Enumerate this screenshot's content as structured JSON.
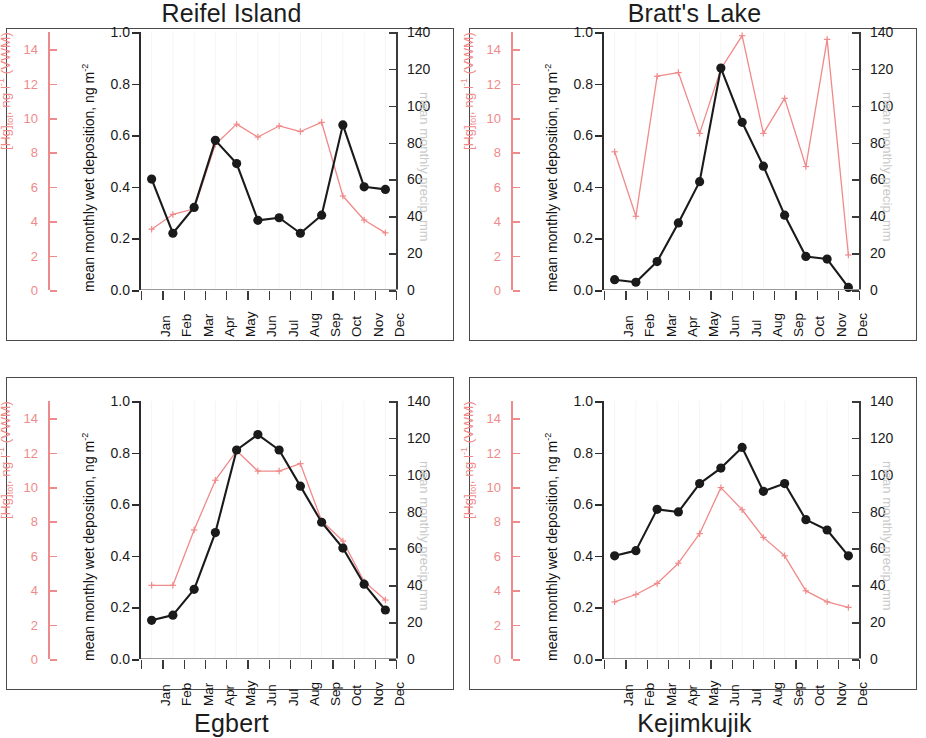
{
  "figure": {
    "months": [
      "Jan",
      "Feb",
      "Mar",
      "Apr",
      "May",
      "Jun",
      "Jul",
      "Aug",
      "Sep",
      "Oct",
      "Nov",
      "Dec"
    ],
    "colors": {
      "hg_red": "#f08a8a",
      "deposition_black": "#1a1a1a",
      "precip_grey": "#c9c9c9",
      "frame": "#4a4a4a"
    },
    "axes": {
      "hg": {
        "label_plain": "[Hg]tot, ng l-1 (VWM)",
        "label_main": "[Hg]",
        "label_sub": "tot",
        "label_mid": ", ng l",
        "label_sup": "-1",
        "label_tail": " (VWM)",
        "ticks": [
          0,
          2,
          4,
          6,
          8,
          10,
          12,
          14
        ],
        "min": 0,
        "max": 15
      },
      "deposition": {
        "label_plain": "mean monthly wet deposition, ng m-2",
        "label_main": "mean monthly wet deposition, ng m",
        "label_sup": "-2",
        "ticks": [
          "0.0",
          "0.2",
          "0.4",
          "0.6",
          "0.8",
          "1.0"
        ],
        "tick_values": [
          0,
          0.2,
          0.4,
          0.6,
          0.8,
          1.0
        ],
        "min": 0,
        "max": 1.0
      },
      "precip": {
        "label_plain": "mean monthly precip, mm",
        "ticks": [
          0,
          20,
          40,
          60,
          80,
          100,
          120,
          140
        ],
        "min": 0,
        "max": 140
      }
    }
  },
  "chart_data": [
    {
      "type": "line",
      "title": "Reifel Island",
      "title_position": "top",
      "panel": "top-left",
      "x": [
        "Jan",
        "Feb",
        "Mar",
        "Apr",
        "May",
        "Jun",
        "Jul",
        "Aug",
        "Sep",
        "Oct",
        "Nov",
        "Dec"
      ],
      "xlabel": "",
      "grid": false,
      "legend": "none",
      "series": [
        {
          "name": "mean monthly wet deposition",
          "axis": "left-black",
          "ylabel": "mean monthly wet deposition, ng m-2",
          "ylim": [
            0,
            1.0
          ],
          "marker": "filled-circle",
          "color": "#1a1a1a",
          "values": [
            0.43,
            0.22,
            0.32,
            0.58,
            0.49,
            0.27,
            0.28,
            0.22,
            0.29,
            0.64,
            0.4,
            0.39
          ]
        },
        {
          "name": "[Hg]tot VWM / mean monthly precip",
          "axis": "right-red",
          "ylabel": "mean monthly precip, mm",
          "ylim": [
            0,
            140
          ],
          "marker": "plus",
          "color": "#f08a8a",
          "values": [
            33,
            41,
            44,
            79,
            90,
            83,
            89,
            86,
            91,
            51,
            38,
            31
          ]
        }
      ]
    },
    {
      "type": "line",
      "title": "Bratt's Lake",
      "title_position": "top",
      "panel": "top-right",
      "x": [
        "Jan",
        "Feb",
        "Mar",
        "Apr",
        "May",
        "Jun",
        "Jul",
        "Aug",
        "Sep",
        "Oct",
        "Nov",
        "Dec"
      ],
      "xlabel": "",
      "grid": false,
      "legend": "none",
      "series": [
        {
          "name": "mean monthly wet deposition",
          "axis": "left-black",
          "ylabel": "mean monthly wet deposition, ng m-2",
          "ylim": [
            0,
            1.0
          ],
          "marker": "filled-circle",
          "color": "#1a1a1a",
          "values": [
            0.04,
            0.03,
            0.11,
            0.26,
            0.42,
            0.86,
            0.65,
            0.48,
            0.29,
            0.13,
            0.12,
            0.01
          ]
        },
        {
          "name": "[Hg]tot VWM / mean monthly precip",
          "axis": "right-red",
          "ylabel": "mean monthly precip, mm",
          "ylim": [
            0,
            140
          ],
          "marker": "plus",
          "color": "#f08a8a",
          "values": [
            75,
            40,
            116,
            118,
            85,
            120,
            138,
            85,
            104,
            67,
            136,
            19
          ]
        }
      ]
    },
    {
      "type": "line",
      "title": "Egbert",
      "title_position": "bottom",
      "panel": "bottom-left",
      "x": [
        "Jan",
        "Feb",
        "Mar",
        "Apr",
        "May",
        "Jun",
        "Jul",
        "Aug",
        "Sep",
        "Oct",
        "Nov",
        "Dec"
      ],
      "xlabel": "",
      "grid": false,
      "legend": "none",
      "series": [
        {
          "name": "mean monthly wet deposition",
          "axis": "left-black",
          "ylabel": "mean monthly wet deposition, ng m-2",
          "ylim": [
            0,
            1.0
          ],
          "marker": "filled-circle",
          "color": "#1a1a1a",
          "values": [
            0.15,
            0.17,
            0.27,
            0.49,
            0.81,
            0.87,
            0.81,
            0.67,
            0.53,
            0.43,
            0.29,
            0.19
          ]
        },
        {
          "name": "[Hg]tot VWM / mean monthly precip",
          "axis": "right-red",
          "ylabel": "mean monthly precip, mm",
          "ylim": [
            0,
            140
          ],
          "marker": "plus",
          "color": "#f08a8a",
          "values": [
            40,
            40,
            70,
            97,
            113,
            102,
            102,
            106,
            75,
            64,
            42,
            32
          ]
        }
      ]
    },
    {
      "type": "line",
      "title": "Kejimkujik",
      "title_position": "bottom",
      "panel": "bottom-right",
      "x": [
        "Jan",
        "Feb",
        "Mar",
        "Apr",
        "May",
        "Jun",
        "Jul",
        "Aug",
        "Sep",
        "Oct",
        "Nov",
        "Dec"
      ],
      "xlabel": "",
      "grid": false,
      "legend": "none",
      "series": [
        {
          "name": "mean monthly wet deposition",
          "axis": "left-black",
          "ylabel": "mean monthly wet deposition, ng m-2",
          "ylim": [
            0,
            1.0
          ],
          "marker": "filled-circle",
          "color": "#1a1a1a",
          "values": [
            0.4,
            0.42,
            0.58,
            0.57,
            0.68,
            0.74,
            0.82,
            0.65,
            0.68,
            0.54,
            0.5,
            0.4
          ]
        },
        {
          "name": "[Hg]tot VWM / mean monthly precip",
          "axis": "right-red",
          "ylabel": "mean monthly precip, mm",
          "ylim": [
            0,
            140
          ],
          "marker": "plus",
          "color": "#f08a8a",
          "values": [
            31,
            35,
            41,
            52,
            68,
            93,
            81,
            66,
            56,
            37,
            31,
            28
          ]
        }
      ]
    }
  ]
}
